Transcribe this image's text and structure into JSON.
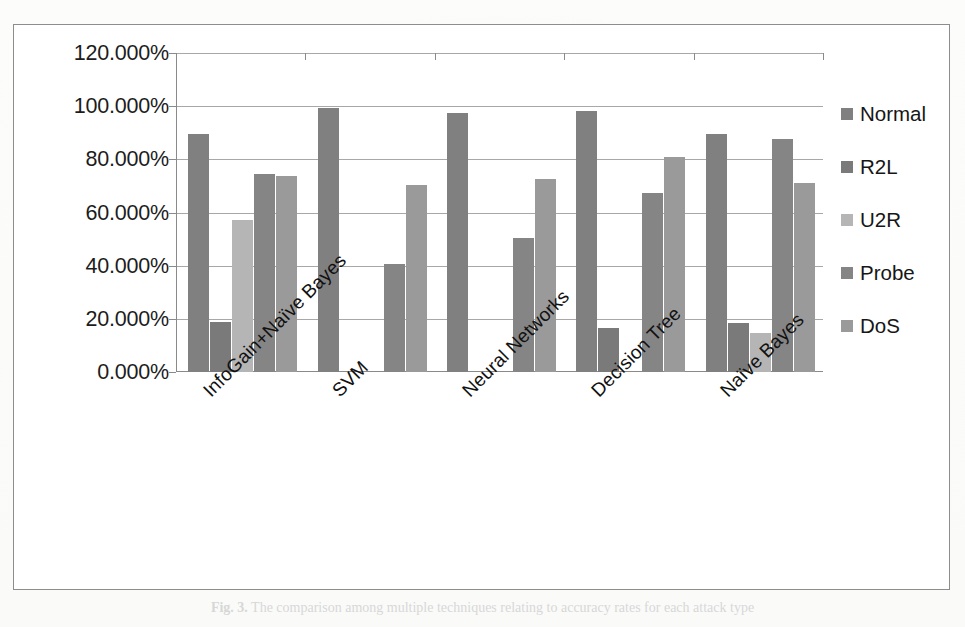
{
  "chart_data": {
    "type": "bar",
    "title": "",
    "xlabel": "",
    "ylabel": "",
    "ylim": [
      0,
      120
    ],
    "ytick_labels": [
      "120.000%",
      "100.000%",
      "80.000%",
      "60.000%",
      "40.000%",
      "20.000%",
      "0.000%"
    ],
    "ytick_values": [
      120,
      100,
      80,
      60,
      40,
      20,
      0
    ],
    "grid": true,
    "legend_position": "right",
    "categories": [
      "InfoGain+Naïve Bayes",
      "SVM",
      "Neural Networks",
      "Decision Tree",
      "Naïve Bayes"
    ],
    "series": [
      {
        "name": "Normal",
        "color": "#808080",
        "values": [
          89.5,
          99.5,
          97.5,
          98.0,
          89.5
        ]
      },
      {
        "name": "R2L",
        "color": "#7a7a7a",
        "values": [
          19.0,
          0,
          0,
          16.5,
          18.5
        ]
      },
      {
        "name": "U2R",
        "color": "#b5b5b5",
        "values": [
          57.0,
          0,
          0,
          0,
          14.5
        ]
      },
      {
        "name": "Probe",
        "color": "#858585",
        "values": [
          74.5,
          40.5,
          50.5,
          67.5,
          87.5
        ]
      },
      {
        "name": "DoS",
        "color": "#9a9a9a",
        "values": [
          73.8,
          70.5,
          72.5,
          81.0,
          71.0
        ]
      }
    ]
  },
  "legend": {
    "items": [
      {
        "label": "Normal"
      },
      {
        "label": "R2L"
      },
      {
        "label": "U2R"
      },
      {
        "label": "Probe"
      },
      {
        "label": "DoS"
      }
    ]
  },
  "caption": {
    "figure_label": "Fig. 3.",
    "text": "The comparison among multiple techniques relating to accuracy rates for each attack type"
  }
}
